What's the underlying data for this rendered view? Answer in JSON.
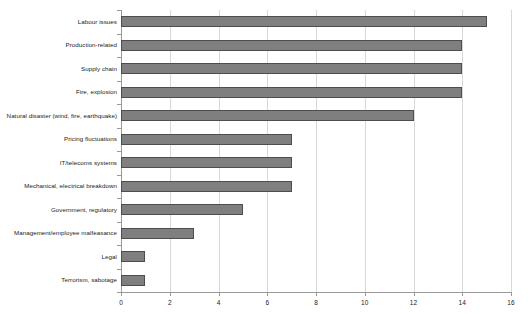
{
  "chart_data": {
    "type": "bar",
    "orientation": "horizontal",
    "title": "",
    "subtitle": "",
    "xlabel": "",
    "ylabel": "",
    "xlim": [
      0,
      16
    ],
    "xticks": [
      0,
      2,
      4,
      6,
      8,
      10,
      12,
      14,
      16
    ],
    "grid": "vertical",
    "legend": "none",
    "bar_color": "#7f7f7f",
    "bar_edge_color": "#4d4d4d",
    "gridline_color": "#d8d8d8",
    "axis_color": "#9a9a9a",
    "categories": [
      "Labour issues",
      "Production-related",
      "Supply chain",
      "Fire, explosion",
      "Natural disaster (wind, fire, earthquake)",
      "Pricing fluctuations",
      "IT/telecoms systems",
      "Mechanical, electrical breakdown",
      "Government, regulatory",
      "Management/employee malfeasance",
      "Legal",
      "Terrorism, sabotage"
    ],
    "values": [
      15,
      14,
      14,
      14,
      12,
      7,
      7,
      7,
      5,
      3,
      1,
      1
    ]
  }
}
